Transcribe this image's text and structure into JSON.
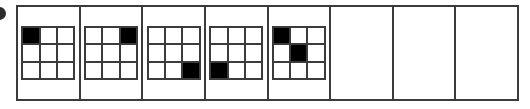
{
  "figure": {
    "type": "sequence-puzzle",
    "frame_count": 8,
    "grid_rows": 3,
    "grid_cols": 3,
    "colors": {
      "filled_cell": "#000000",
      "empty_cell": "#ffffff",
      "grid_line": "#3b3b3b",
      "frame_border": "#3b3b3b",
      "background": "#ffffff",
      "bullet_marker": "#2b2b2b"
    },
    "bullet_marker": "bullet-circle-cropped",
    "frames": [
      {
        "index": 1,
        "label": "frame-1",
        "empty": false,
        "filled_cells": [
          "r1c1"
        ],
        "cells": [
          [
            1,
            0,
            0
          ],
          [
            0,
            0,
            0
          ],
          [
            0,
            0,
            0
          ]
        ]
      },
      {
        "index": 2,
        "label": "frame-2",
        "empty": false,
        "filled_cells": [
          "r1c3"
        ],
        "cells": [
          [
            0,
            0,
            1
          ],
          [
            0,
            0,
            0
          ],
          [
            0,
            0,
            0
          ]
        ]
      },
      {
        "index": 3,
        "label": "frame-3",
        "empty": false,
        "filled_cells": [
          "r3c3"
        ],
        "cells": [
          [
            0,
            0,
            0
          ],
          [
            0,
            0,
            0
          ],
          [
            0,
            0,
            1
          ]
        ]
      },
      {
        "index": 4,
        "label": "frame-4",
        "empty": false,
        "filled_cells": [
          "r3c1"
        ],
        "cells": [
          [
            0,
            0,
            0
          ],
          [
            0,
            0,
            0
          ],
          [
            1,
            0,
            0
          ]
        ]
      },
      {
        "index": 5,
        "label": "frame-5",
        "empty": false,
        "filled_cells": [
          "r1c1",
          "r2c2"
        ],
        "cells": [
          [
            1,
            0,
            0
          ],
          [
            0,
            1,
            0
          ],
          [
            0,
            0,
            0
          ]
        ]
      },
      {
        "index": 6,
        "label": "frame-6",
        "empty": true,
        "filled_cells": [],
        "cells": [
          [
            0,
            0,
            0
          ],
          [
            0,
            0,
            0
          ],
          [
            0,
            0,
            0
          ]
        ]
      },
      {
        "index": 7,
        "label": "frame-7",
        "empty": true,
        "filled_cells": [],
        "cells": [
          [
            0,
            0,
            0
          ],
          [
            0,
            0,
            0
          ],
          [
            0,
            0,
            0
          ]
        ]
      },
      {
        "index": 8,
        "label": "frame-8",
        "empty": true,
        "filled_cells": [],
        "cells": [
          [
            0,
            0,
            0
          ],
          [
            0,
            0,
            0
          ],
          [
            0,
            0,
            0
          ]
        ]
      }
    ]
  }
}
